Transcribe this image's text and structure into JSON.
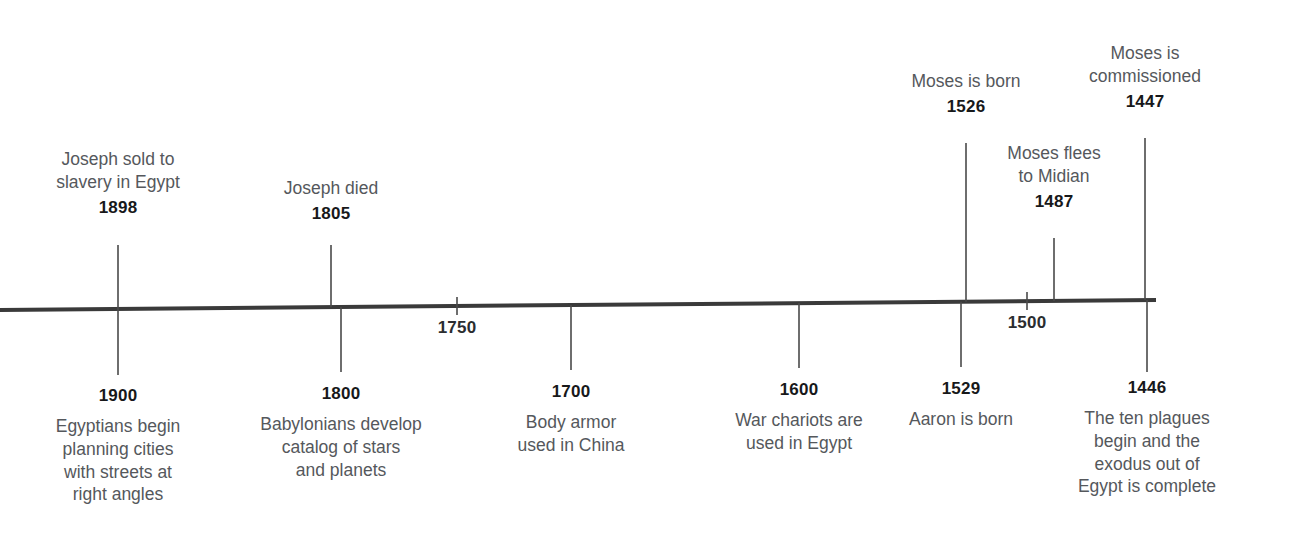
{
  "chart_data": {
    "type": "timeline",
    "title": "",
    "orientation": "horizontal",
    "direction": "descending-bc-years",
    "axis": {
      "x_start_px": 0,
      "x_end_px": 1156,
      "y_left_px": 310,
      "y_right_px": 300,
      "color": "#3a3a3a",
      "thickness_px": 4,
      "grid": false
    },
    "axis_ticks": [
      {
        "label": "1750",
        "x": 457,
        "side": "below"
      },
      {
        "label": "1500",
        "x": 1027,
        "side": "below"
      }
    ],
    "events_above": [
      {
        "year": "1898",
        "description": "Joseph sold to\nslavery in Egypt",
        "x": 118,
        "label_top": 148,
        "connector_top": 245
      },
      {
        "year": "1805",
        "description": "Joseph died",
        "x": 331,
        "label_top": 177,
        "connector_top": 245
      },
      {
        "year": "1526",
        "description": "Moses is born",
        "x": 966,
        "label_top": 70,
        "connector_top": 143
      },
      {
        "year": "1487",
        "description": "Moses flees\nto Midian",
        "x": 1054,
        "label_top": 142,
        "connector_top": 238
      },
      {
        "year": "1447",
        "description": "Moses is\ncommissioned",
        "x": 1145,
        "label_top": 42,
        "connector_top": 138
      }
    ],
    "events_below": [
      {
        "year": "1900",
        "description": "Egyptians begin\nplanning cities\nwith streets at\nright angles",
        "x": 118,
        "label_top": 385,
        "connector_bottom": 375
      },
      {
        "year": "1800",
        "description": "Babylonians develop\ncatalog of stars\nand planets",
        "x": 341,
        "label_top": 383,
        "connector_bottom": 372
      },
      {
        "year": "1700",
        "description": "Body armor\nused in China",
        "x": 571,
        "label_top": 381,
        "connector_bottom": 370
      },
      {
        "year": "1600",
        "description": "War chariots are\nused in Egypt",
        "x": 799,
        "label_top": 379,
        "connector_bottom": 368
      },
      {
        "year": "1529",
        "description": "Aaron is born",
        "x": 961,
        "label_top": 378,
        "connector_bottom": 367
      },
      {
        "year": "1446",
        "description": "The ten plagues\nbegin and the\nexodus out of\nEgypt is complete",
        "x": 1147,
        "label_top": 377,
        "connector_bottom": 372
      }
    ],
    "colors": {
      "background": "#ffffff",
      "axis": "#3a3a3a",
      "connector": "#4a4a4a",
      "year_text": "#17181a",
      "description_text": "#55585c",
      "tick_text": "#2b2d30"
    }
  }
}
